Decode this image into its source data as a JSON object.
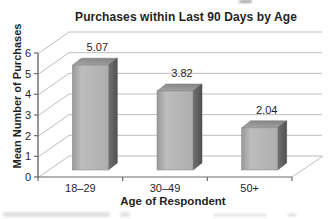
{
  "chart_data": {
    "type": "bar",
    "style": "3d-bar",
    "title": "Purchases within Last 90 Days by Age",
    "xlabel": "Age of Respondent",
    "ylabel": "Mean Number of Purchases",
    "categories": [
      "18–29",
      "30–49",
      "50+"
    ],
    "values": [
      5.07,
      3.82,
      2.04
    ],
    "value_labels": [
      "5.07",
      "3.82",
      "2.04"
    ],
    "ylim": [
      0,
      6
    ],
    "yticks": [
      0,
      1,
      2,
      3,
      4,
      5,
      6
    ],
    "ytick_labels": [
      "0",
      "1",
      "2",
      "3",
      "4",
      "5",
      "6"
    ],
    "grid": true,
    "legend": "none",
    "colors": {
      "background": "#ffffff",
      "text": "#1f1f1f",
      "gridline": "#bdbdbd",
      "axis": "#6b6b6b",
      "bar_front": "#b3b3b3",
      "bar_top": "#949494",
      "bar_side": "#5c5c5c"
    }
  }
}
